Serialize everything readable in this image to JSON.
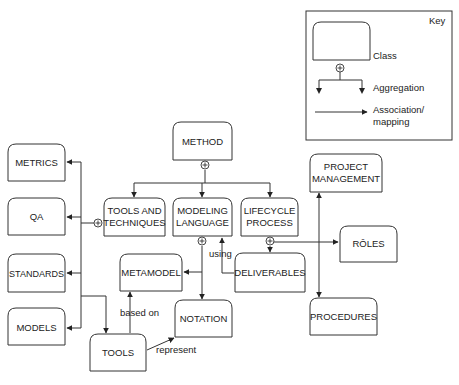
{
  "key": {
    "title": "Key",
    "class_label": "Class",
    "aggregation_label": "Aggregation",
    "association_label_line1": "Association/",
    "association_label_line2": "mapping"
  },
  "nodes": {
    "method": {
      "line1": "METHOD"
    },
    "tools_techniques": {
      "line1": "TOOLS AND",
      "line2": "TECHNIQUES"
    },
    "modeling_language": {
      "line1": "MODELING",
      "line2": "LANGUAGE"
    },
    "lifecycle_process": {
      "line1": "LIFECYCLE",
      "line2": "PROCESS"
    },
    "metrics": {
      "line1": "METRICS"
    },
    "qa": {
      "line1": "QA"
    },
    "standards": {
      "line1": "STANDARDS"
    },
    "models": {
      "line1": "MODELS"
    },
    "metamodel": {
      "line1": "METAMODEL"
    },
    "notation": {
      "line1": "NOTATION"
    },
    "tools": {
      "line1": "TOOLS"
    },
    "deliverables": {
      "line1": "DELIVERABLES"
    },
    "project_management": {
      "line1": "PROJECT",
      "line2": "MANAGEMENT"
    },
    "roles": {
      "line1": "RÔLES"
    },
    "procedures": {
      "line1": "PROCEDURES"
    }
  },
  "edge_labels": {
    "using": "using",
    "based_on": "based on",
    "represent": "represent"
  }
}
